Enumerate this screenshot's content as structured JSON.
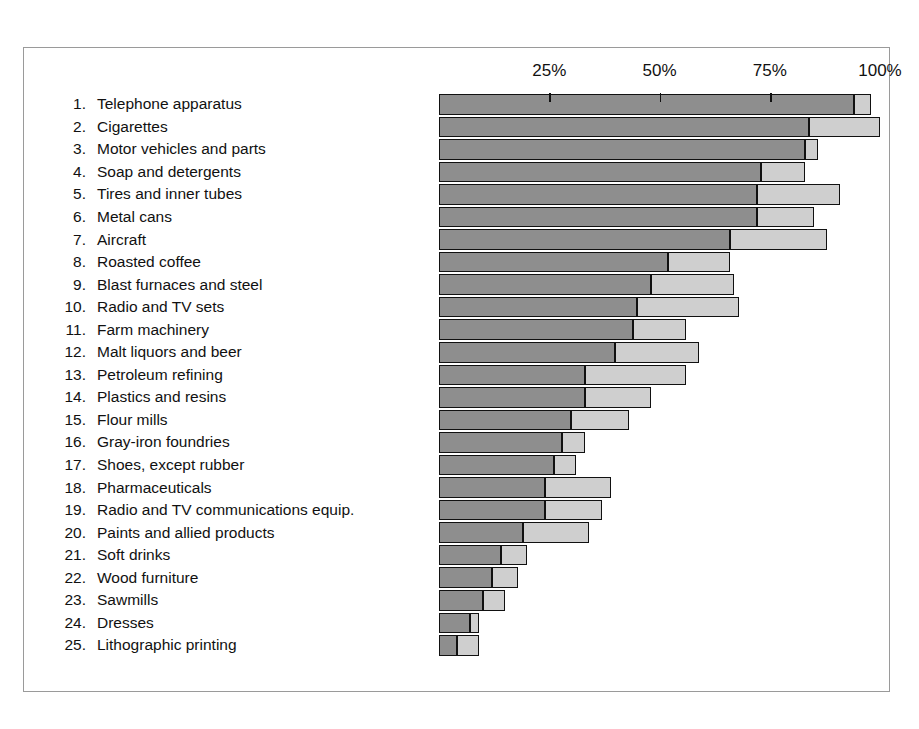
{
  "chart_data": {
    "type": "bar",
    "orientation": "horizontal",
    "stacked": true,
    "title": "",
    "subtitle": "",
    "xlabel": "",
    "ylabel": "",
    "xlim": [
      0,
      105
    ],
    "grid": false,
    "legend_position": "none",
    "axis_ticks": [
      {
        "value": 25,
        "label": "25%"
      },
      {
        "value": 50,
        "label": "50%"
      },
      {
        "value": 75,
        "label": "75%"
      },
      {
        "value": 100,
        "label": "100%"
      }
    ],
    "series": [
      {
        "name": "primary-segment",
        "color": "#8e8e8e"
      },
      {
        "name": "secondary-segment",
        "color": "#cfcfcf"
      }
    ],
    "categories": [
      "Telephone apparatus",
      "Cigarettes",
      "Motor vehicles and parts",
      "Soap and detergents",
      "Tires and inner tubes",
      "Metal cans",
      "Aircraft",
      "Roasted coffee",
      "Blast furnaces and steel",
      "Radio and TV sets",
      "Farm machinery",
      "Malt liquors and beer",
      "Petroleum refining",
      "Plastics and resins",
      "Flour mills",
      "Gray-iron foundries",
      "Shoes, except rubber",
      "Pharmaceuticals",
      "Radio and TV communications equip.",
      "Paints and allied products",
      "Soft drinks",
      "Wood furniture",
      "Sawmills",
      "Dresses",
      "Lithographic printing"
    ],
    "rows": [
      {
        "rank": "1.",
        "label": "Telephone apparatus",
        "primary": 94,
        "secondary": 4,
        "total": 98
      },
      {
        "rank": "2.",
        "label": "Cigarettes",
        "primary": 84,
        "secondary": 16,
        "total": 100
      },
      {
        "rank": "3.",
        "label": "Motor vehicles and parts",
        "primary": 83,
        "secondary": 3,
        "total": 86
      },
      {
        "rank": "4.",
        "label": "Soap and detergents",
        "primary": 73,
        "secondary": 10,
        "total": 83
      },
      {
        "rank": "5.",
        "label": "Tires and inner tubes",
        "primary": 72,
        "secondary": 19,
        "total": 91
      },
      {
        "rank": "6.",
        "label": "Metal cans",
        "primary": 72,
        "secondary": 13,
        "total": 85
      },
      {
        "rank": "7.",
        "label": "Aircraft",
        "primary": 66,
        "secondary": 22,
        "total": 88
      },
      {
        "rank": "8.",
        "label": "Roasted coffee",
        "primary": 52,
        "secondary": 14,
        "total": 66
      },
      {
        "rank": "9.",
        "label": "Blast furnaces and steel",
        "primary": 48,
        "secondary": 19,
        "total": 67
      },
      {
        "rank": "10.",
        "label": "Radio and TV sets",
        "primary": 45,
        "secondary": 23,
        "total": 68
      },
      {
        "rank": "11.",
        "label": "Farm machinery",
        "primary": 44,
        "secondary": 12,
        "total": 56
      },
      {
        "rank": "12.",
        "label": "Malt liquors and beer",
        "primary": 40,
        "secondary": 19,
        "total": 59
      },
      {
        "rank": "13.",
        "label": "Petroleum refining",
        "primary": 33,
        "secondary": 23,
        "total": 56
      },
      {
        "rank": "14.",
        "label": "Plastics and resins",
        "primary": 33,
        "secondary": 15,
        "total": 48
      },
      {
        "rank": "15.",
        "label": "Flour mills",
        "primary": 30,
        "secondary": 13,
        "total": 43
      },
      {
        "rank": "16.",
        "label": "Gray-iron foundries",
        "primary": 28,
        "secondary": 5,
        "total": 33
      },
      {
        "rank": "17.",
        "label": "Shoes, except rubber",
        "primary": 26,
        "secondary": 5,
        "total": 31
      },
      {
        "rank": "18.",
        "label": "Pharmaceuticals",
        "primary": 24,
        "secondary": 15,
        "total": 39
      },
      {
        "rank": "19.",
        "label": "Radio and TV communications equip.",
        "primary": 24,
        "secondary": 13,
        "total": 37
      },
      {
        "rank": "20.",
        "label": "Paints and allied products",
        "primary": 19,
        "secondary": 15,
        "total": 34
      },
      {
        "rank": "21.",
        "label": "Soft drinks",
        "primary": 14,
        "secondary": 6,
        "total": 20
      },
      {
        "rank": "22.",
        "label": "Wood furniture",
        "primary": 12,
        "secondary": 6,
        "total": 18
      },
      {
        "rank": "23.",
        "label": "Sawmills",
        "primary": 10,
        "secondary": 5,
        "total": 15
      },
      {
        "rank": "24.",
        "label": "Dresses",
        "primary": 7,
        "secondary": 2,
        "total": 9
      },
      {
        "rank": "25.",
        "label": "Lithographic printing",
        "primary": 4,
        "secondary": 5,
        "total": 9
      }
    ]
  },
  "colors": {
    "primary_segment": "#8e8e8e",
    "secondary_segment": "#cfcfcf",
    "outline": "#111111",
    "frame": "#9a9a9a",
    "background": "#ffffff"
  }
}
